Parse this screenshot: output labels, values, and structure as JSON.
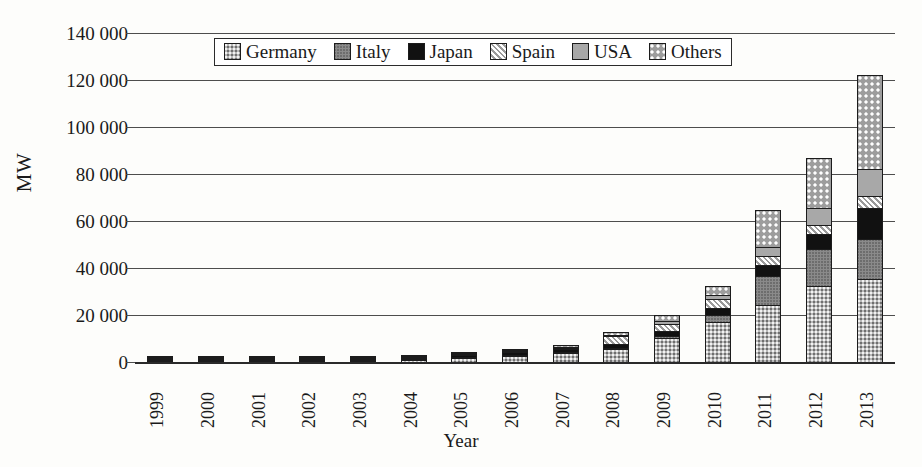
{
  "chart_data": {
    "type": "bar",
    "subtype": "stacked-bar",
    "title": "",
    "xlabel": "Year",
    "ylabel": "MW",
    "ylim": [
      0,
      140000
    ],
    "ytick_step": 20000,
    "grid": true,
    "legend_position": "top-center",
    "categories": [
      "1999",
      "2000",
      "2001",
      "2002",
      "2003",
      "2004",
      "2005",
      "2006",
      "2007",
      "2008",
      "2009",
      "2010",
      "2011",
      "2012",
      "2013"
    ],
    "ytick_labels": [
      "0",
      "20 000",
      "40 000",
      "60 000",
      "80 000",
      "100 000",
      "120 000",
      "140 000"
    ],
    "ytick_values": [
      0,
      20000,
      40000,
      60000,
      80000,
      100000,
      120000,
      140000
    ],
    "series": [
      {
        "name": "Germany",
        "pattern": "light-stipple",
        "values": [
          70,
          114,
          195,
          296,
          435,
          1105,
          2056,
          2899,
          4170,
          6120,
          10566,
          17320,
          24820,
          32640,
          35715
        ]
      },
      {
        "name": "Italy",
        "pattern": "dark-gray",
        "values": [
          18,
          22,
          20,
          22,
          26,
          31,
          38,
          50,
          120,
          458,
          1181,
          3502,
          12800,
          16350,
          17600
        ]
      },
      {
        "name": "Japan",
        "pattern": "black",
        "values": [
          209,
          330,
          453,
          637,
          860,
          1132,
          1422,
          1709,
          1919,
          2144,
          2627,
          3618,
          4914,
          6632,
          13600
        ]
      },
      {
        "name": "Spain",
        "pattern": "diagonal-hatch",
        "values": [
          9,
          12,
          16,
          20,
          30,
          37,
          58,
          145,
          705,
          3463,
          3520,
          3892,
          4260,
          4560,
          5340
        ]
      },
      {
        "name": "USA",
        "pattern": "solid-gray",
        "values": [
          117,
          139,
          168,
          212,
          275,
          376,
          479,
          624,
          831,
          1169,
          1616,
          2528,
          4383,
          7665,
          12079
        ]
      },
      {
        "name": "Others",
        "pattern": "checker",
        "values": [
          77,
          113,
          148,
          213,
          274,
          419,
          547,
          873,
          1055,
          1536,
          3090,
          4040,
          16263,
          21453,
          40466
        ]
      }
    ],
    "totals": [
      500,
      730,
      1000,
      1400,
      1900,
      3100,
      4600,
      6300,
      8800,
      14890,
      22600,
      34900,
      67440,
      89300,
      124800
    ]
  },
  "legend": {
    "items": [
      {
        "label": "Germany",
        "swatch": "p-germany"
      },
      {
        "label": "Italy",
        "swatch": "p-italy"
      },
      {
        "label": "Japan",
        "swatch": "p-japan"
      },
      {
        "label": "Spain",
        "swatch": "p-spain"
      },
      {
        "label": "USA",
        "swatch": "p-usa"
      },
      {
        "label": "Others",
        "swatch": "p-others"
      }
    ]
  }
}
